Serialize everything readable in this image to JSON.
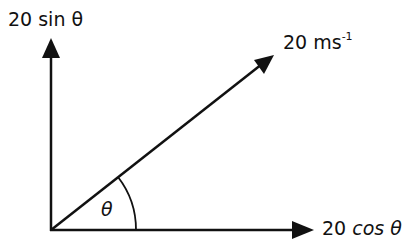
{
  "diagram": {
    "type": "vector-resolution",
    "labels": {
      "vertical_component": "20 sin θ",
      "resultant_value": "20 ms",
      "resultant_exponent": "-1",
      "horizontal_component_num": "20",
      "horizontal_component_fn": "cos θ",
      "angle": "θ"
    },
    "colors": {
      "stroke": "#111111",
      "background": "#ffffff"
    }
  }
}
